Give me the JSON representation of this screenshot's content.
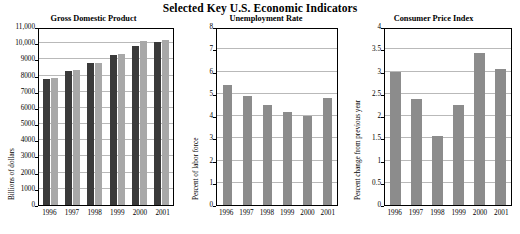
{
  "figure": {
    "title": "Selected Key U.S. Economic Indicators"
  },
  "chart_data": [
    {
      "type": "bar",
      "title": "Gross Domestic Product",
      "xlabel": "",
      "ylabel": "Billions of dollars",
      "categories": [
        "1996",
        "1997",
        "1998",
        "1999",
        "2000",
        "2001"
      ],
      "series": [
        {
          "name": "current dollars",
          "color": "#3a3a3a",
          "values": [
            7816,
            8304,
            8747,
            9268,
            9817,
            10082
          ]
        },
        {
          "name": "chained dollars",
          "color": "#a8a8a8",
          "values": [
            7838,
            8332,
            8794,
            9354,
            10128,
            10208
          ]
        }
      ],
      "ylim": [
        0,
        11000
      ],
      "yticks": [
        "0",
        "1000",
        "2000",
        "3000",
        "4000",
        "5000",
        "6000",
        "7000",
        "8000",
        "9000",
        "10,000",
        "11,000"
      ],
      "ytick_values": [
        0,
        1000,
        2000,
        3000,
        4000,
        5000,
        6000,
        7000,
        8000,
        9000,
        10000,
        11000
      ],
      "grid": true,
      "legend": "none"
    },
    {
      "type": "bar",
      "title": "Unemployment Rate",
      "xlabel": "",
      "ylabel": "Percent of labor force",
      "categories": [
        "1996",
        "1997",
        "1998",
        "1999",
        "2000",
        "2001"
      ],
      "values": [
        5.4,
        4.9,
        4.5,
        4.2,
        4.0,
        4.8
      ],
      "color": "#8c8c8c",
      "ylim": [
        0,
        8
      ],
      "yticks": [
        "0",
        "1",
        "2",
        "3",
        "4",
        "5",
        "6",
        "7",
        "8"
      ],
      "ytick_values": [
        0,
        1,
        2,
        3,
        4,
        5,
        6,
        7,
        8
      ],
      "grid": true,
      "legend": "none"
    },
    {
      "type": "bar",
      "title": "Consumer Price Index",
      "xlabel": "",
      "ylabel": "Percent change from previous year",
      "categories": [
        "1996",
        "1997",
        "1998",
        "1999",
        "2000",
        "2001"
      ],
      "values": [
        3.0,
        2.38,
        1.55,
        2.25,
        3.41,
        3.05
      ],
      "color": "#8c8c8c",
      "ylim": [
        0,
        4
      ],
      "yticks": [
        "0",
        "0.5",
        "1",
        "1.5",
        "2",
        "2.5",
        "3",
        "3.5",
        "4"
      ],
      "ytick_values": [
        0,
        0.5,
        1,
        1.5,
        2,
        2.5,
        3,
        3.5,
        4
      ],
      "grid": true,
      "legend": "none"
    }
  ]
}
